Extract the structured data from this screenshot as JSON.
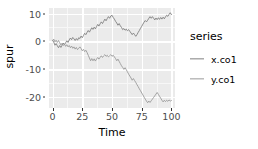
{
  "chart_data": {
    "type": "line",
    "title": "",
    "xlabel": "Time",
    "ylabel": "spur",
    "xlim": [
      -3,
      103
    ],
    "ylim": [
      -24,
      12
    ],
    "x_ticks": [
      0,
      25,
      50,
      75,
      100
    ],
    "x_tick_labels": [
      "0",
      "25",
      "50",
      "75",
      "100"
    ],
    "y_ticks": [
      10,
      0,
      -10,
      -20
    ],
    "y_tick_labels": [
      "10",
      "0",
      "-10",
      "-20"
    ],
    "grid": true,
    "legend_position": "right",
    "legend_title": "series",
    "panel_background": "#ebebeb",
    "grid_color": "#ffffff",
    "series": [
      {
        "name": "x.co1",
        "color": "#808080",
        "x": [
          0,
          1,
          2,
          3,
          4,
          5,
          6,
          7,
          8,
          9,
          10,
          11,
          12,
          13,
          14,
          15,
          16,
          17,
          18,
          19,
          20,
          21,
          22,
          23,
          24,
          25,
          26,
          27,
          28,
          29,
          30,
          31,
          32,
          33,
          34,
          35,
          36,
          37,
          38,
          39,
          40,
          41,
          42,
          43,
          44,
          45,
          46,
          47,
          48,
          49,
          50,
          51,
          52,
          53,
          54,
          55,
          56,
          57,
          58,
          59,
          60,
          61,
          62,
          63,
          64,
          65,
          66,
          67,
          68,
          69,
          70,
          71,
          72,
          73,
          74,
          75,
          76,
          77,
          78,
          79,
          80,
          81,
          82,
          83,
          84,
          85,
          86,
          87,
          88,
          89,
          90,
          91,
          92,
          93,
          94,
          95,
          96,
          97,
          98,
          99,
          100
        ],
        "values": [
          0.4,
          -0.3,
          -1.4,
          -0.8,
          -1.6,
          -2.3,
          -1.5,
          -2.2,
          -1.4,
          -0.6,
          -1.2,
          -0.5,
          0.2,
          -0.4,
          0.5,
          1.2,
          0.6,
          1.4,
          0.9,
          0.3,
          1.0,
          0.4,
          1.3,
          1.0,
          1.9,
          1.3,
          2.1,
          2.9,
          2.4,
          3.2,
          3.9,
          3.3,
          4.1,
          4.9,
          4.3,
          5.1,
          4.5,
          5.3,
          6.1,
          5.5,
          6.3,
          7.0,
          6.4,
          7.2,
          8.0,
          7.4,
          8.2,
          8.9,
          8.3,
          9.1,
          9.4,
          8.6,
          8.0,
          7.2,
          6.6,
          5.8,
          6.4,
          5.6,
          5.0,
          4.2,
          4.6,
          4.0,
          4.4,
          3.8,
          4.2,
          3.6,
          3.0,
          2.4,
          3.0,
          2.4,
          1.8,
          2.4,
          3.2,
          3.9,
          4.7,
          5.4,
          6.2,
          6.9,
          7.5,
          7.0,
          7.6,
          8.3,
          8.9,
          8.3,
          8.9,
          8.3,
          7.7,
          8.4,
          7.8,
          8.5,
          7.9,
          8.6,
          8.0,
          8.7,
          8.1,
          8.8,
          9.4,
          9.0,
          9.7,
          10.3,
          9.6
        ]
      },
      {
        "name": "y.co1",
        "color": "#9a9a9a",
        "x": [
          0,
          1,
          2,
          3,
          4,
          5,
          6,
          7,
          8,
          9,
          10,
          11,
          12,
          13,
          14,
          15,
          16,
          17,
          18,
          19,
          20,
          21,
          22,
          23,
          24,
          25,
          26,
          27,
          28,
          29,
          30,
          31,
          32,
          33,
          34,
          35,
          36,
          37,
          38,
          39,
          40,
          41,
          42,
          43,
          44,
          45,
          46,
          47,
          48,
          49,
          50,
          51,
          52,
          53,
          54,
          55,
          56,
          57,
          58,
          59,
          60,
          61,
          62,
          63,
          64,
          65,
          66,
          67,
          68,
          69,
          70,
          71,
          72,
          73,
          74,
          75,
          76,
          77,
          78,
          79,
          80,
          81,
          82,
          83,
          84,
          85,
          86,
          87,
          88,
          89,
          90,
          91,
          92,
          93,
          94,
          95,
          96,
          97,
          98,
          99,
          100
        ],
        "values": [
          0.2,
          0.8,
          -0.2,
          0.4,
          -0.4,
          0.3,
          -0.5,
          -1.3,
          -0.7,
          -1.5,
          -1.0,
          -1.8,
          -1.2,
          -2.0,
          -1.5,
          -2.3,
          -1.7,
          -2.5,
          -2.0,
          -2.8,
          -2.2,
          -3.0,
          -2.5,
          -2.0,
          -2.6,
          -3.4,
          -2.9,
          -3.7,
          -3.2,
          -4.0,
          -5.0,
          -6.0,
          -7.0,
          -6.2,
          -7.0,
          -6.3,
          -7.1,
          -6.4,
          -5.8,
          -6.4,
          -5.8,
          -5.2,
          -5.8,
          -5.2,
          -4.8,
          -5.4,
          -5.0,
          -5.6,
          -5.2,
          -4.8,
          -5.4,
          -5.0,
          -5.6,
          -6.2,
          -7.0,
          -6.4,
          -7.2,
          -8.0,
          -8.8,
          -9.4,
          -10.1,
          -9.5,
          -10.2,
          -11.0,
          -11.8,
          -12.5,
          -13.2,
          -14.0,
          -13.4,
          -14.1,
          -14.8,
          -15.6,
          -16.3,
          -17.1,
          -17.8,
          -18.6,
          -19.3,
          -20.1,
          -20.8,
          -21.5,
          -22.1,
          -21.5,
          -22.0,
          -21.4,
          -20.8,
          -20.2,
          -19.6,
          -19.0,
          -18.4,
          -19.1,
          -19.8,
          -20.5,
          -21.2,
          -21.8,
          -21.2,
          -21.7,
          -21.2,
          -21.6,
          -21.1,
          -21.5,
          -21.3
        ]
      }
    ]
  },
  "legend": {
    "title": "series",
    "items": [
      {
        "label": "x.co1"
      },
      {
        "label": "y.co1"
      }
    ]
  },
  "axes": {
    "x_title": "Time",
    "y_title": "spur"
  }
}
